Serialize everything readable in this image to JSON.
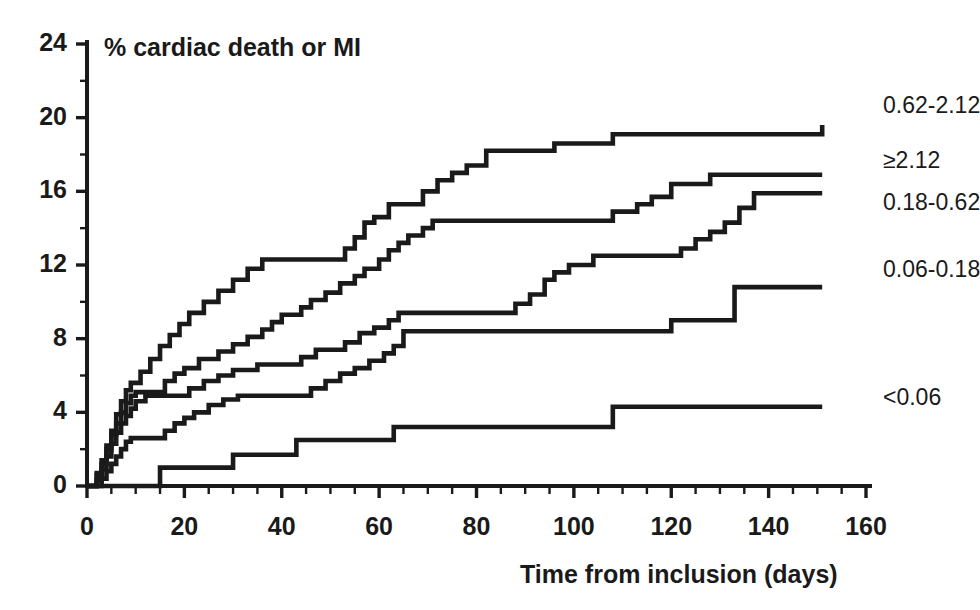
{
  "chart_data": {
    "type": "line",
    "subtype": "kaplan-meier-step",
    "title": "% cardiac death or MI",
    "xlabel": "Time from inclusion (days)",
    "ylabel": "% cardiac death or MI",
    "xlim": [
      0,
      160
    ],
    "ylim": [
      0,
      24
    ],
    "x_major_ticks": [
      0,
      20,
      40,
      60,
      80,
      100,
      120,
      140,
      160
    ],
    "x_tick_labels": [
      "0",
      "20",
      "40",
      "60",
      "80",
      "100",
      "120",
      "140",
      "160"
    ],
    "x_minor_interval": 5,
    "y_major_ticks": [
      0,
      4,
      8,
      12,
      16,
      20,
      24
    ],
    "y_tick_labels": [
      "0",
      "4",
      "8",
      "12",
      "16",
      "20",
      "24"
    ],
    "y_minor_interval": 2,
    "grid": false,
    "legend_position": "right-inline-end-of-curve",
    "series": [
      {
        "name": "0.62-2.12",
        "label": "0.62-2.12",
        "label_x": 160,
        "label_y": 20.6,
        "end_value": 19.6,
        "points": [
          [
            0,
            0
          ],
          [
            2,
            0.7
          ],
          [
            3,
            1.4
          ],
          [
            4,
            2.2
          ],
          [
            5,
            3.0
          ],
          [
            6,
            3.9
          ],
          [
            7,
            4.6
          ],
          [
            8,
            5.2
          ],
          [
            9,
            5.6
          ],
          [
            11,
            6.2
          ],
          [
            13,
            6.9
          ],
          [
            15,
            7.6
          ],
          [
            17,
            8.2
          ],
          [
            19,
            8.8
          ],
          [
            21,
            9.4
          ],
          [
            24,
            10.0
          ],
          [
            27,
            10.6
          ],
          [
            30,
            11.2
          ],
          [
            33,
            11.8
          ],
          [
            36,
            12.3
          ],
          [
            38,
            12.3
          ],
          [
            50,
            12.3
          ],
          [
            53,
            12.9
          ],
          [
            55,
            13.5
          ],
          [
            57,
            14.3
          ],
          [
            59,
            14.6
          ],
          [
            62,
            15.3
          ],
          [
            66,
            15.3
          ],
          [
            69,
            16.0
          ],
          [
            72,
            16.6
          ],
          [
            75,
            17.0
          ],
          [
            78,
            17.4
          ],
          [
            82,
            18.2
          ],
          [
            92,
            18.2
          ],
          [
            96,
            18.6
          ],
          [
            108,
            19.1
          ],
          [
            150,
            19.1
          ],
          [
            151,
            19.6
          ]
        ]
      },
      {
        "name": "≥2.12",
        "label": "≥2.12",
        "label_x": 160,
        "label_y": 17.6,
        "end_value": 16.9,
        "points": [
          [
            0,
            0
          ],
          [
            2,
            0.6
          ],
          [
            3,
            1.2
          ],
          [
            4,
            2.0
          ],
          [
            5,
            2.8
          ],
          [
            6,
            3.4
          ],
          [
            7,
            4.0
          ],
          [
            8,
            4.5
          ],
          [
            9,
            4.9
          ],
          [
            10,
            5.1
          ],
          [
            13,
            5.1
          ],
          [
            16,
            5.7
          ],
          [
            18,
            6.1
          ],
          [
            20,
            6.4
          ],
          [
            23,
            6.9
          ],
          [
            27,
            7.3
          ],
          [
            30,
            7.7
          ],
          [
            33,
            8.1
          ],
          [
            36,
            8.5
          ],
          [
            38,
            8.9
          ],
          [
            40,
            9.3
          ],
          [
            44,
            9.7
          ],
          [
            46,
            10.1
          ],
          [
            49,
            10.5
          ],
          [
            52,
            11.0
          ],
          [
            55,
            11.4
          ],
          [
            57,
            11.8
          ],
          [
            60,
            12.3
          ],
          [
            62,
            12.8
          ],
          [
            64,
            13.2
          ],
          [
            66,
            13.6
          ],
          [
            69,
            14.0
          ],
          [
            71,
            14.4
          ],
          [
            75,
            14.4
          ],
          [
            104,
            14.4
          ],
          [
            108,
            14.9
          ],
          [
            113,
            15.3
          ],
          [
            116,
            15.7
          ],
          [
            120,
            16.4
          ],
          [
            128,
            16.9
          ],
          [
            150,
            16.9
          ],
          [
            151,
            16.9
          ]
        ]
      },
      {
        "name": "0.18-0.62",
        "label": "0.18-0.62",
        "label_x": 160,
        "label_y": 15.3,
        "end_value": 15.9,
        "points": [
          [
            0,
            0
          ],
          [
            2,
            0.3
          ],
          [
            3,
            0.9
          ],
          [
            4,
            1.6
          ],
          [
            5,
            2.3
          ],
          [
            6,
            2.9
          ],
          [
            7,
            3.4
          ],
          [
            8,
            3.8
          ],
          [
            9,
            4.2
          ],
          [
            10,
            4.6
          ],
          [
            12,
            4.9
          ],
          [
            14,
            4.9
          ],
          [
            18,
            4.9
          ],
          [
            21,
            5.3
          ],
          [
            24,
            5.7
          ],
          [
            27,
            6.0
          ],
          [
            30,
            6.3
          ],
          [
            35,
            6.6
          ],
          [
            38,
            6.6
          ],
          [
            44,
            7.0
          ],
          [
            47,
            7.4
          ],
          [
            50,
            7.4
          ],
          [
            53,
            7.8
          ],
          [
            56,
            8.3
          ],
          [
            59,
            8.6
          ],
          [
            62,
            9.0
          ],
          [
            64,
            9.4
          ],
          [
            66,
            9.4
          ],
          [
            84,
            9.4
          ],
          [
            88,
            9.9
          ],
          [
            91,
            10.4
          ],
          [
            94,
            11.2
          ],
          [
            96,
            11.6
          ],
          [
            99,
            12.0
          ],
          [
            104,
            12.5
          ],
          [
            118,
            12.5
          ],
          [
            122,
            12.9
          ],
          [
            125,
            13.4
          ],
          [
            128,
            13.8
          ],
          [
            131,
            14.3
          ],
          [
            134,
            15.1
          ],
          [
            137,
            15.9
          ],
          [
            150,
            15.9
          ],
          [
            151,
            15.9
          ]
        ]
      },
      {
        "name": "0.06-0.18",
        "label": "0.06-0.18",
        "label_x": 160,
        "label_y": 11.7,
        "end_value": 10.8,
        "points": [
          [
            0,
            0
          ],
          [
            3,
            0.4
          ],
          [
            4,
            0.8
          ],
          [
            5,
            1.2
          ],
          [
            6,
            1.6
          ],
          [
            7,
            2.0
          ],
          [
            8,
            2.4
          ],
          [
            9,
            2.6
          ],
          [
            11,
            2.6
          ],
          [
            14,
            2.6
          ],
          [
            16,
            3.0
          ],
          [
            18,
            3.4
          ],
          [
            20,
            3.7
          ],
          [
            22,
            4.0
          ],
          [
            25,
            4.4
          ],
          [
            28,
            4.7
          ],
          [
            31,
            4.9
          ],
          [
            34,
            4.9
          ],
          [
            40,
            4.9
          ],
          [
            46,
            5.3
          ],
          [
            49,
            5.7
          ],
          [
            52,
            6.1
          ],
          [
            55,
            6.4
          ],
          [
            58,
            6.8
          ],
          [
            61,
            7.2
          ],
          [
            63,
            7.6
          ],
          [
            65,
            8.4
          ],
          [
            68,
            8.4
          ],
          [
            80,
            8.4
          ],
          [
            118,
            8.4
          ],
          [
            120,
            9.0
          ],
          [
            131,
            9.0
          ],
          [
            133,
            10.8
          ],
          [
            150,
            10.8
          ],
          [
            151,
            10.8
          ]
        ]
      },
      {
        "name": "<0.06",
        "label": "<0.06",
        "label_x": 160,
        "label_y": 4.7,
        "end_value": 4.3,
        "points": [
          [
            0,
            0
          ],
          [
            14,
            0
          ],
          [
            15,
            1.0
          ],
          [
            29,
            1.0
          ],
          [
            30,
            1.7
          ],
          [
            42,
            1.7
          ],
          [
            43,
            2.5
          ],
          [
            62,
            2.5
          ],
          [
            63,
            3.2
          ],
          [
            107,
            3.2
          ],
          [
            108,
            4.3
          ],
          [
            150,
            4.3
          ],
          [
            151,
            4.3
          ]
        ]
      }
    ]
  },
  "axes": {
    "x_label": "Time from inclusion (days)",
    "y_series_title": "% cardiac death or MI"
  }
}
